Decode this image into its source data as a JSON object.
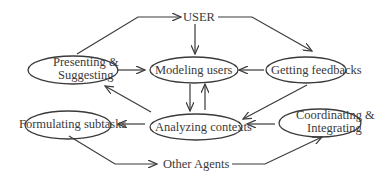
{
  "diagram": {
    "nodes": {
      "user": {
        "label": "USER"
      },
      "presenting": {
        "line1": "Presenting &",
        "line2": "Suggesting"
      },
      "modeling": {
        "label": "Modeling users"
      },
      "feedback": {
        "label": "Getting feedbacks"
      },
      "formulating": {
        "label": "Formulating subtasks"
      },
      "analyzing": {
        "label": "Analyzing contexts"
      },
      "coordinating": {
        "line1": "Coordinating &",
        "line2": "Integrating"
      },
      "agents": {
        "label": "Other Agents"
      }
    },
    "edges": [
      {
        "from": "Presenting & Suggesting",
        "to": "USER"
      },
      {
        "from": "USER",
        "to": "Modeling users"
      },
      {
        "from": "USER",
        "to": "Getting feedbacks"
      },
      {
        "from": "Presenting & Suggesting",
        "to": "Modeling users"
      },
      {
        "from": "Getting feedbacks",
        "to": "Modeling users"
      },
      {
        "from": "Modeling users",
        "to": "Analyzing contexts"
      },
      {
        "from": "Analyzing contexts",
        "to": "Modeling users"
      },
      {
        "from": "Analyzing contexts",
        "to": "Presenting & Suggesting"
      },
      {
        "from": "Getting feedbacks",
        "to": "Analyzing contexts"
      },
      {
        "from": "Coordinating & Integrating",
        "to": "Analyzing contexts"
      },
      {
        "from": "Analyzing contexts",
        "to": "Formulating subtasks"
      },
      {
        "from": "Formulating subtasks",
        "to": "Other Agents"
      },
      {
        "from": "Other Agents",
        "to": "Coordinating & Integrating"
      }
    ],
    "colors": {
      "stroke": "#3a3a3a",
      "background": "#ffffff"
    }
  }
}
